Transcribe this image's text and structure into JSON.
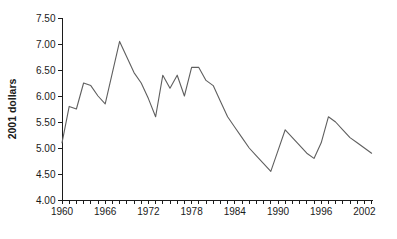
{
  "chart": {
    "background_color": "#ffffff",
    "line_color": "#5f5f5f",
    "axis_color": "#1c1c1c"
  },
  "chart_data": {
    "type": "line",
    "title": "",
    "xlabel": "",
    "ylabel": "2001 dollars",
    "ylim": [
      4.0,
      7.5
    ],
    "ytick_step": 0.5,
    "grid": false,
    "legend": "none",
    "x": [
      1960,
      1961,
      1962,
      1963,
      1964,
      1965,
      1966,
      1967,
      1968,
      1969,
      1970,
      1971,
      1972,
      1973,
      1974,
      1975,
      1976,
      1977,
      1978,
      1979,
      1980,
      1981,
      1982,
      1983,
      1984,
      1985,
      1986,
      1987,
      1988,
      1989,
      1990,
      1991,
      1992,
      1993,
      1994,
      1995,
      1996,
      1997,
      1998,
      1999,
      2000,
      2001,
      2002,
      2003
    ],
    "values": [
      5.1,
      5.8,
      5.75,
      6.25,
      6.2,
      6.0,
      5.85,
      6.45,
      7.05,
      6.75,
      6.45,
      6.25,
      5.95,
      5.6,
      6.4,
      6.15,
      6.4,
      6.0,
      6.55,
      6.55,
      6.3,
      6.2,
      5.9,
      5.6,
      5.4,
      5.2,
      5.0,
      4.85,
      4.7,
      4.55,
      4.95,
      5.35,
      5.2,
      5.05,
      4.9,
      4.8,
      5.1,
      5.6,
      5.5,
      5.35,
      5.2,
      5.1,
      5.0,
      4.9
    ],
    "y_tick_labels": [
      "7.50",
      "7.00",
      "6.50",
      "6.00",
      "5.50",
      "5.00",
      "4.50",
      "4.00"
    ],
    "x_tick_labels": [
      "1960",
      "1966",
      "1972",
      "1978",
      "1984",
      "1990",
      "1996",
      "2002"
    ],
    "x_minor_tick_every_year": true
  }
}
